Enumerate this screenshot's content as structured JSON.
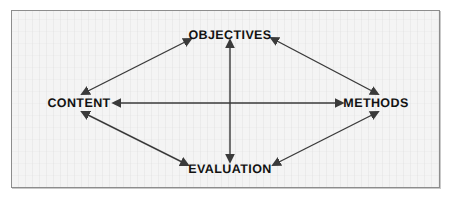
{
  "diagram": {
    "background_color": "#f4f4f4",
    "border_color": "#8d8d8d",
    "arrow_color": "#3a3a3a",
    "text_color": "#121212",
    "nodes": [
      {
        "id": "objectives",
        "label": "OBJECTIVES",
        "x": 230,
        "y": 35
      },
      {
        "id": "content",
        "label": "CONTENT",
        "x": 79,
        "y": 103
      },
      {
        "id": "methods",
        "label": "METHODS",
        "x": 376,
        "y": 103
      },
      {
        "id": "evaluation",
        "label": "EVALUATION",
        "x": 230,
        "y": 169
      }
    ],
    "connectors": [
      {
        "id": "objectives-evaluation",
        "from": "objectives",
        "to": "evaluation",
        "style": "double-headed",
        "orientation": "vertical"
      },
      {
        "id": "content-methods",
        "from": "content",
        "to": "methods",
        "style": "double-headed",
        "orientation": "horizontal"
      },
      {
        "id": "content-objectives",
        "from": "content",
        "to": "objectives",
        "style": "double-headed",
        "orientation": "diagonal"
      },
      {
        "id": "objectives-methods",
        "from": "objectives",
        "to": "methods",
        "style": "double-headed",
        "orientation": "diagonal"
      },
      {
        "id": "content-evaluation",
        "from": "content",
        "to": "evaluation",
        "style": "double-headed",
        "orientation": "diagonal"
      },
      {
        "id": "evaluation-methods",
        "from": "evaluation",
        "to": "methods",
        "style": "double-headed",
        "orientation": "diagonal"
      }
    ]
  }
}
